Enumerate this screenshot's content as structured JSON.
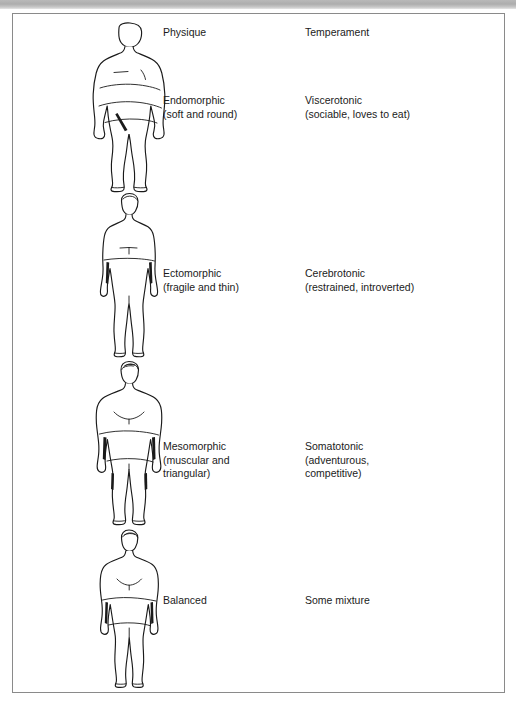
{
  "page": {
    "background_color": "#ffffff",
    "frame_border_color": "#8a8a8a",
    "scan_band_color": "#b9b9b9",
    "ink_color": "#1a1a1a"
  },
  "columns": {
    "physique_header": "Physique",
    "temperament_header": "Temperament"
  },
  "rows": [
    {
      "figure_name": "endomorph-body-figure",
      "figure_description": "heavyset rounded male body outline",
      "physique": {
        "name": "Endomorphic",
        "detail": "(soft and round)"
      },
      "temperament": {
        "name": "Viscerotonic",
        "detail": "(sociable, loves to eat)"
      }
    },
    {
      "figure_name": "ectomorph-body-figure",
      "figure_description": "thin slender male body outline",
      "physique": {
        "name": "Ectomorphic",
        "detail": "(fragile and thin)"
      },
      "temperament": {
        "name": "Cerebrotonic",
        "detail": "(restrained, introverted)"
      }
    },
    {
      "figure_name": "mesomorph-body-figure",
      "figure_description": "muscular broad shouldered male body outline",
      "physique": {
        "name": "Mesomorphic",
        "detail": "(muscular and",
        "detail2": "triangular)"
      },
      "temperament": {
        "name": "Somatotonic",
        "detail": "(adventurous,",
        "detail2": "competitive)"
      }
    },
    {
      "figure_name": "balanced-body-figure",
      "figure_description": "average balanced male body outline",
      "physique": {
        "name": "Balanced"
      },
      "temperament": {
        "name": "Some mixture"
      }
    }
  ]
}
